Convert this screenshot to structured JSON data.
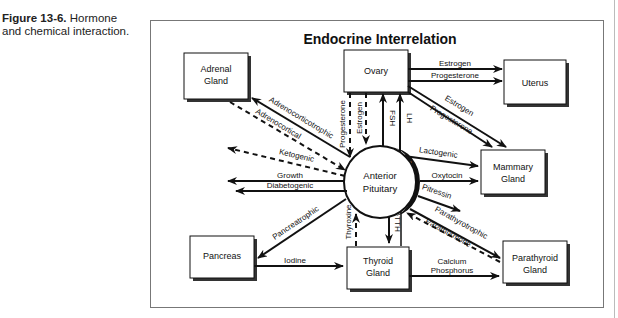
{
  "caption": {
    "label": "Figure 13-6.",
    "text_line1": "Hormone",
    "text_line2": "and chemical interaction."
  },
  "diagram": {
    "title": "Endocrine Interrelation",
    "nodes": {
      "center": {
        "line1": "Anterior",
        "line2": "Pituitary"
      },
      "post": {
        "letters": [
          "P",
          "O",
          "S",
          "T"
        ]
      },
      "adrenal": {
        "line1": "Adrenal",
        "line2": "Gland"
      },
      "ovary": {
        "line1": "Ovary"
      },
      "uterus": {
        "line1": "Uterus"
      },
      "mammary": {
        "line1": "Mammary",
        "line2": "Gland"
      },
      "pancreas": {
        "line1": "Pancreas"
      },
      "thyroid": {
        "line1": "Thyroid",
        "line2": "Gland"
      },
      "parathyroid": {
        "line1": "Parathyroid",
        "line2": "Gland"
      }
    },
    "edges": {
      "ovary_uterus_estrogen": "Estrogen",
      "ovary_uterus_progesterone": "Progesterone",
      "ovary_mammary_estrogen": "Estrogen",
      "ovary_mammary_progesterone": "Progesterone",
      "ovary_pit_progesterone": "Progesterone",
      "ovary_pit_estrogen": "Estrogen",
      "pit_ovary_fsh": "FSH",
      "pit_ovary_lh": "LH",
      "pit_adrenal": "Adrenocorticotrophic",
      "adrenal_pit": "Adrenocortical",
      "ketogenic": "Ketogenic",
      "growth": "Growth",
      "diabetogenic": "Diabetogenic",
      "lactogenic": "Lactogenic",
      "oxytocin": "Oxytocin",
      "pitressin": "Pitressin",
      "parathyrotrophic": "Parathyrotrophic",
      "parathormone": "Parathormone",
      "pancreatrophic": "Pancreatrophic",
      "thyroxine": "Thyroxine",
      "tth": "TTH",
      "iodine": "Iodine",
      "calcium": "Calcium",
      "phosphorus": "Phosphorus"
    }
  }
}
